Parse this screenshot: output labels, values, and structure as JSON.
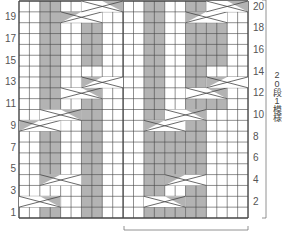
{
  "chart_title": "Cable knitting chart",
  "grid": {
    "cols": 22,
    "rows": 20,
    "x0": 19,
    "y0": 1,
    "cell_w": 10.41,
    "cell_h": 10.85,
    "center_divider_col": 10
  },
  "colors": {
    "gray": "#b3b3b3",
    "line": "#444444",
    "white": "#ffffff",
    "label": "#555555"
  },
  "row_labels_left": [
    "19",
    "17",
    "15",
    "13",
    "11",
    "9",
    "7",
    "5",
    "3",
    "1"
  ],
  "row_labels_right": [
    "20",
    "18",
    "16",
    "14",
    "12",
    "10",
    "8",
    "6",
    "4",
    "2"
  ],
  "repeat_label": "20段1模様",
  "static_gray": [
    {
      "cols": [
        12,
        13
      ],
      "rows": [
        1,
        20
      ]
    },
    {
      "cols": [
        16,
        17
      ],
      "rows": [
        1,
        20
      ]
    },
    {
      "cols": [
        6,
        7
      ],
      "rows": [
        1,
        10
      ]
    },
    {
      "cols": [
        2,
        3
      ],
      "rows": [
        11,
        20
      ]
    }
  ],
  "cable_gray": [
    {
      "cols": [
        2,
        3
      ],
      "rows": [
        1,
        1
      ]
    },
    {
      "cols": [
        2,
        3
      ],
      "rows": [
        5,
        8
      ]
    },
    {
      "cols": [
        6,
        7
      ],
      "rows": [
        11,
        11
      ]
    },
    {
      "cols": [
        6,
        7
      ],
      "rows": [
        15,
        18
      ]
    },
    {
      "cols": [
        14,
        15
      ],
      "rows": [
        1,
        1
      ]
    },
    {
      "cols": [
        14,
        15
      ],
      "rows": [
        5,
        8
      ]
    },
    {
      "cols": [
        18,
        19
      ],
      "rows": [
        11,
        11
      ]
    },
    {
      "cols": [
        18,
        19
      ],
      "rows": [
        15,
        18
      ]
    }
  ],
  "crossings": [
    {
      "col": 0,
      "row": 2,
      "w": 4,
      "dir": "right"
    },
    {
      "col": 2,
      "row": 4,
      "w": 4,
      "dir": "left"
    },
    {
      "col": 0,
      "row": 9,
      "w": 4,
      "dir": "left"
    },
    {
      "col": 2,
      "row": 10,
      "w": 4,
      "dir": "right"
    },
    {
      "col": 4,
      "row": 12,
      "w": 4,
      "dir": "right"
    },
    {
      "col": 6,
      "row": 13,
      "w": 4,
      "dir": "left"
    },
    {
      "col": 4,
      "row": 19,
      "w": 4,
      "dir": "left"
    },
    {
      "col": 6,
      "row": 20,
      "w": 4,
      "dir": "right"
    },
    {
      "col": 12,
      "row": 2,
      "w": 4,
      "dir": "right"
    },
    {
      "col": 14,
      "row": 4,
      "w": 4,
      "dir": "left"
    },
    {
      "col": 12,
      "row": 9,
      "w": 4,
      "dir": "left"
    },
    {
      "col": 14,
      "row": 10,
      "w": 4,
      "dir": "right"
    },
    {
      "col": 16,
      "row": 12,
      "w": 4,
      "dir": "right"
    },
    {
      "col": 18,
      "row": 13,
      "w": 4,
      "dir": "left"
    },
    {
      "col": 16,
      "row": 19,
      "w": 4,
      "dir": "left"
    },
    {
      "col": 18,
      "row": 20,
      "w": 4,
      "dir": "right"
    }
  ],
  "bracket_bottom": {
    "x1": 124,
    "x2": 248,
    "y": 230
  },
  "bracket_right": {
    "x": 266,
    "y1": 0,
    "y2": 218
  }
}
